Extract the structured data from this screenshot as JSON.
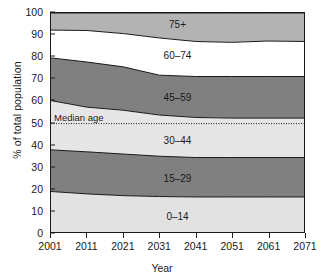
{
  "chart_data": {
    "type": "area",
    "title": "",
    "xlabel": "Year",
    "ylabel": "% of total population",
    "xlim": [
      2001,
      2071
    ],
    "ylim": [
      0,
      100
    ],
    "grid": false,
    "legend_position": "in-plot band labels",
    "x": [
      2001,
      2011,
      2021,
      2031,
      2041,
      2051,
      2061,
      2071
    ],
    "xticks": [
      "2001",
      "2011",
      "2021",
      "2031",
      "2041",
      "2051",
      "2061",
      "2071"
    ],
    "yticks": [
      "0",
      "10",
      "20",
      "30",
      "40",
      "50",
      "60",
      "70",
      "80",
      "90",
      "100"
    ],
    "stacking": "cumulative from bottom",
    "series": [
      {
        "name": "0-14",
        "label": "0–14",
        "color": "#e2e2e2",
        "cumulative_top": [
          18.5,
          17.4,
          16.6,
          16.2,
          16.0,
          16.0,
          16.0,
          16.0
        ],
        "values": [
          18.5,
          17.4,
          16.6,
          16.2,
          16.0,
          16.0,
          16.0,
          16.0
        ]
      },
      {
        "name": "15-29",
        "label": "15–29",
        "color": "#808080",
        "cumulative_top": [
          37.5,
          36.6,
          35.6,
          34.6,
          34.0,
          34.0,
          34.0,
          34.0
        ],
        "values": [
          19.0,
          19.2,
          19.0,
          18.4,
          18.0,
          18.0,
          18.0,
          18.0
        ]
      },
      {
        "name": "30-44",
        "label": "30–44",
        "color": "#e6e6e6",
        "cumulative_top": [
          60.0,
          57.0,
          55.6,
          53.4,
          52.3,
          52.0,
          52.0,
          52.0
        ],
        "values": [
          22.5,
          20.4,
          20.0,
          18.8,
          18.3,
          18.0,
          18.0,
          18.0
        ]
      },
      {
        "name": "45-59",
        "label": "45–59",
        "color": "#808080",
        "cumulative_top": [
          79.5,
          77.6,
          75.4,
          71.6,
          71.0,
          71.0,
          71.0,
          71.0
        ],
        "values": [
          19.5,
          20.6,
          19.8,
          18.2,
          18.7,
          19.0,
          19.0,
          19.0
        ]
      },
      {
        "name": "60-74",
        "label": "60–74",
        "color": "#ffffff",
        "cumulative_top": [
          92.2,
          92.0,
          90.6,
          88.6,
          87.0,
          86.6,
          87.2,
          87.0
        ],
        "values": [
          12.7,
          14.4,
          15.2,
          17.0,
          16.0,
          15.6,
          16.2,
          16.0
        ]
      },
      {
        "name": "75+",
        "label": "75+",
        "color": "#b3b3b3",
        "cumulative_top": [
          100,
          100,
          100,
          100,
          100,
          100,
          100,
          100
        ],
        "values": [
          7.8,
          8.0,
          9.4,
          11.4,
          13.0,
          13.4,
          12.8,
          13.0
        ]
      }
    ],
    "annotations": [
      {
        "name": "median-age",
        "label": "Median age",
        "y": 49.5,
        "style": "dotted horizontal line"
      }
    ],
    "band_label_positions": [
      {
        "series": "0-14",
        "x": 2036,
        "y": 7.5
      },
      {
        "series": "15-29",
        "x": 2036,
        "y": 25.0
      },
      {
        "series": "30-44",
        "x": 2036,
        "y": 42.0
      },
      {
        "series": "45-59",
        "x": 2036,
        "y": 61.5
      },
      {
        "series": "60-74",
        "x": 2036,
        "y": 80.5
      },
      {
        "series": "75+",
        "x": 2036,
        "y": 94.5
      }
    ]
  }
}
